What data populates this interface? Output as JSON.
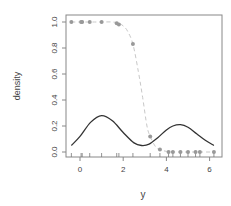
{
  "chart_data": {
    "type": "line",
    "title": "",
    "xlabel": "y",
    "ylabel": "density",
    "xlim": [
      -0.6,
      6.4
    ],
    "ylim": [
      -0.03,
      1.03
    ],
    "x_ticks": [
      0,
      2,
      4,
      6
    ],
    "x_tick_labels": [
      "0",
      "2",
      "4",
      "6"
    ],
    "y_ticks": [
      0.0,
      0.2,
      0.4,
      0.6,
      0.8,
      1.0
    ],
    "y_tick_labels": [
      "0.0",
      "0.2",
      "0.4",
      "0.6",
      "0.8",
      "1.0"
    ],
    "grid": false,
    "legend": null,
    "series": [
      {
        "name": "density",
        "style": "solid",
        "color": "#333333",
        "x": [
          -0.4,
          0.0,
          0.5,
          1.0,
          1.5,
          2.0,
          2.5,
          2.85,
          3.2,
          3.6,
          4.0,
          4.3,
          4.65,
          5.0,
          5.4,
          5.8,
          6.2
        ],
        "y": [
          0.05,
          0.12,
          0.23,
          0.28,
          0.24,
          0.15,
          0.07,
          0.05,
          0.06,
          0.11,
          0.17,
          0.2,
          0.21,
          0.19,
          0.14,
          0.09,
          0.05
        ]
      },
      {
        "name": "fitted probability",
        "style": "dashed",
        "color": "#bbbbbb",
        "x": [
          -0.4,
          0.5,
          1.0,
          1.5,
          1.8,
          2.0,
          2.2,
          2.45,
          2.7,
          2.9,
          3.1,
          3.25,
          3.5,
          3.7,
          4.0,
          4.5,
          5.0,
          5.5,
          6.2
        ],
        "y": [
          1.0,
          1.0,
          1.0,
          1.0,
          0.99,
          0.97,
          0.93,
          0.83,
          0.62,
          0.42,
          0.2,
          0.12,
          0.04,
          0.02,
          0.005,
          0.0,
          0.0,
          0.0,
          0.0
        ]
      },
      {
        "name": "observations",
        "style": "points",
        "color": "#999999",
        "x": [
          -0.4,
          0.05,
          0.1,
          0.45,
          1.0,
          1.7,
          1.8,
          2.45,
          3.25,
          3.7,
          4.1,
          4.3,
          4.65,
          5.0,
          5.35,
          5.55,
          6.2
        ],
        "y": [
          1.0,
          1.0,
          1.0,
          1.0,
          1.0,
          0.99,
          0.98,
          0.83,
          0.12,
          0.02,
          0.0,
          0.0,
          0.0,
          0.0,
          0.0,
          0.0,
          0.0
        ]
      }
    ],
    "rug": [
      -0.4,
      0.05,
      0.1,
      0.45,
      1.0,
      1.7,
      1.8,
      2.45,
      3.25,
      3.7,
      4.1,
      4.3,
      4.65,
      5.0,
      5.35,
      5.55,
      6.2
    ]
  }
}
